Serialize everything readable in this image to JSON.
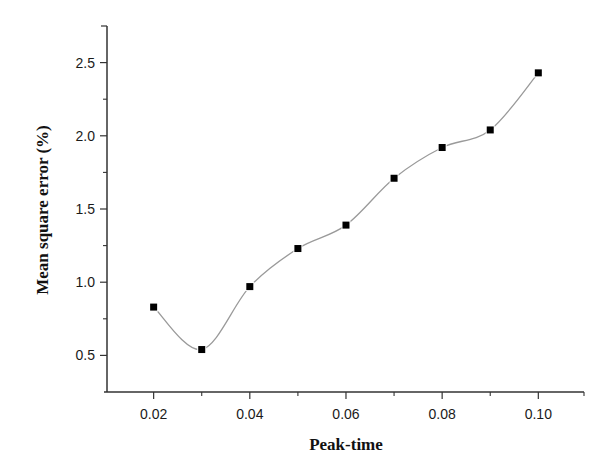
{
  "chart_data": {
    "type": "line",
    "title": "",
    "xlabel": "Peak-time",
    "ylabel": "Mean square error (%)",
    "x": [
      0.02,
      0.03,
      0.04,
      0.05,
      0.06,
      0.07,
      0.08,
      0.09,
      0.1
    ],
    "series": [
      {
        "name": "Mean square error",
        "values": [
          0.83,
          0.54,
          0.97,
          1.23,
          1.39,
          1.71,
          1.92,
          2.04,
          2.43
        ],
        "marker": "square",
        "line": "smooth spline"
      }
    ],
    "xlim": [
      0.0103,
      0.1095
    ],
    "ylim": [
      0.25,
      2.75
    ],
    "xticks": [
      0.02,
      0.04,
      0.06,
      0.08,
      0.1
    ],
    "xtick_labels": [
      "0.02",
      "0.04",
      "0.06",
      "0.08",
      "0.10"
    ],
    "xminor_ticks": [
      0.03,
      0.05,
      0.07,
      0.09
    ],
    "yticks": [
      0.5,
      1.0,
      1.5,
      2.0,
      2.5
    ],
    "ytick_labels": [
      "0.5",
      "1.0",
      "1.5",
      "2.0",
      "2.5"
    ],
    "yminor_ticks": [
      0.75,
      1.25,
      1.75,
      2.25
    ],
    "grid": false,
    "legend": null
  },
  "colors": {
    "axis": "#333333",
    "line": "#9a9a9a",
    "marker": "#000000",
    "text": "#1a1a1a"
  }
}
